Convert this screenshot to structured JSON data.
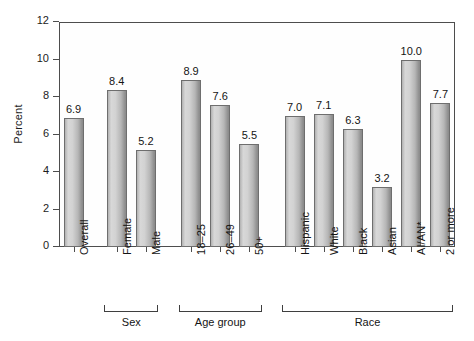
{
  "chart_data": {
    "type": "bar",
    "title": "",
    "xlabel": "",
    "ylabel": "Percent",
    "ylim": [
      0,
      12
    ],
    "yticks": [
      "0",
      "2",
      "4",
      "6",
      "8",
      "10",
      "12"
    ],
    "grid": false,
    "legend": "none",
    "categories": [
      "Overall",
      "Female",
      "Male",
      "18–25",
      "26–49",
      "50+",
      "Hispanic",
      "White",
      "Black",
      "Asian",
      "AI/AN*",
      "2 or more"
    ],
    "values": [
      6.9,
      8.4,
      5.2,
      8.9,
      7.6,
      5.5,
      7.0,
      7.1,
      6.3,
      3.2,
      10.0,
      7.7
    ],
    "value_labels": [
      "6.9",
      "8.4",
      "5.2",
      "8.9",
      "7.6",
      "5.5",
      "7.0",
      "7.1",
      "6.3",
      "3.2",
      "10.0",
      "7.7"
    ],
    "groups": [
      {
        "label": "Sex",
        "first": 1,
        "last": 2
      },
      {
        "label": "Age group",
        "first": 3,
        "last": 5
      },
      {
        "label": "Race",
        "first": 6,
        "last": 11
      }
    ],
    "bar_color": "#c9c9c9",
    "bar_edge_color": "#6e6e6e",
    "axis_color": "#4d4d4d",
    "text_color": "#141414"
  }
}
